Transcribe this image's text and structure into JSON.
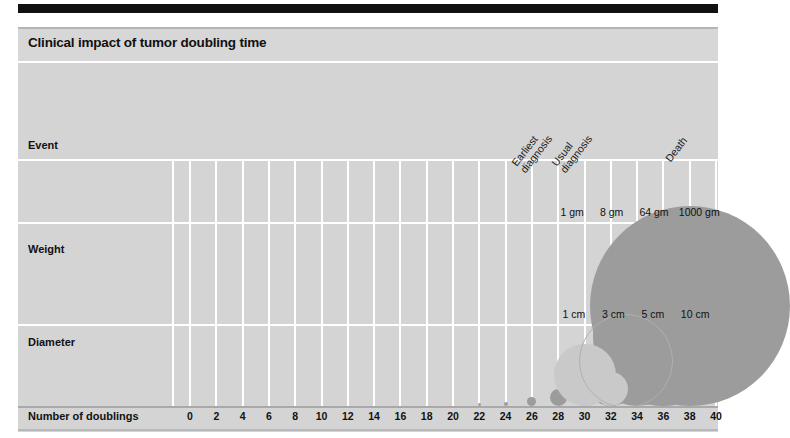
{
  "figure": {
    "title": "Clinical impact of tumor doubling time",
    "background_color": "#d4d4d4",
    "bubble_color": "#9c9c9c",
    "bubble_highlight_color": "#c9c9c9",
    "gridline_color": "#ffffff"
  },
  "rows": {
    "event_label": "Event",
    "weight_label": "Weight",
    "diameter_label": "Diameter",
    "axis_label": "Number of doublings"
  },
  "chart_data": {
    "type": "bar",
    "title": "Clinical impact of tumor doubling time",
    "xlabel": "Number of doublings",
    "ylabel": "",
    "xlim": [
      0,
      41
    ],
    "grid": true,
    "legend_position": "none",
    "categories": [
      "0",
      "2",
      "4",
      "6",
      "8",
      "10",
      "12",
      "14",
      "16",
      "18",
      "20",
      "22",
      "24",
      "26",
      "28",
      "30",
      "32",
      "34",
      "36",
      "38",
      "40"
    ],
    "x": [
      0,
      2,
      4,
      6,
      8,
      10,
      12,
      14,
      16,
      18,
      20,
      22,
      24,
      26,
      28,
      30,
      32,
      34,
      36,
      38,
      40
    ],
    "series": [
      {
        "name": "Tumor size (bubble diameter)",
        "values": [
          0,
          0,
          0,
          0,
          0,
          0,
          0,
          0,
          0,
          0,
          0,
          0.6,
          1.2,
          3.4,
          7.5,
          14,
          26,
          44,
          72,
          110,
          150
        ]
      }
    ],
    "annotations": {
      "events": [
        {
          "label_line1": "Earliest",
          "label_line2": "diagnosis",
          "doublings": 27
        },
        {
          "label_line1": "Usual",
          "label_line2": "diagnosis",
          "doublings": 30
        },
        {
          "label_line1": "Death",
          "label_line2": "",
          "doublings": 38
        }
      ],
      "weights": [
        {
          "text": "1 gm",
          "doublings": 30
        },
        {
          "text": "8 gm",
          "doublings": 33
        },
        {
          "text": "64 gm",
          "doublings": 36
        },
        {
          "text": "1000 gm",
          "doublings": 39
        }
      ],
      "diameters": [
        {
          "text": "1 cm",
          "doublings": 30
        },
        {
          "text": "3 cm",
          "doublings": 33
        },
        {
          "text": "5 cm",
          "doublings": 36
        },
        {
          "text": "10 cm",
          "doublings": 39
        }
      ]
    },
    "bubbles": [
      {
        "doublings": 22,
        "pixel_diameter": 3
      },
      {
        "doublings": 24,
        "pixel_diameter": 4
      },
      {
        "doublings": 26,
        "pixel_diameter": 9
      },
      {
        "doublings": 28,
        "pixel_diameter": 17
      },
      {
        "doublings": 30,
        "pixel_diameter": 30
      },
      {
        "doublings": 32,
        "pixel_diameter": 52
      },
      {
        "doublings": 34,
        "pixel_diameter": 88
      },
      {
        "doublings": 36,
        "pixel_diameter": 140
      },
      {
        "doublings": 38,
        "pixel_diameter": 200
      }
    ]
  },
  "ticks": [
    "0",
    "2",
    "4",
    "6",
    "8",
    "10",
    "12",
    "14",
    "16",
    "18",
    "20",
    "22",
    "24",
    "26",
    "28",
    "30",
    "32",
    "34",
    "36",
    "38",
    "40"
  ],
  "events": [
    {
      "line1": "Earliest",
      "line2": "diagnosis"
    },
    {
      "line1": "Usual",
      "line2": "diagnosis"
    },
    {
      "line1": "Death",
      "line2": ""
    }
  ],
  "weights": [
    "1 gm",
    "8 gm",
    "64 gm",
    "1000 gm"
  ],
  "diameters": [
    "1 cm",
    "3 cm",
    "5 cm",
    "10 cm"
  ]
}
